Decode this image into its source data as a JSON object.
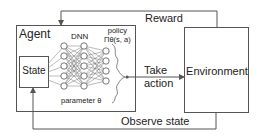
{
  "diagram": {
    "agent": {
      "label": "Agent"
    },
    "state": {
      "label": "State"
    },
    "dnn": {
      "label": "DNN",
      "parameter_label": "parameter θ",
      "layers": [
        5,
        5,
        4
      ]
    },
    "policy": {
      "label": "policy",
      "formula": "Πθ(s, a)"
    },
    "action": {
      "label_line1": "Take",
      "label_line2": "action"
    },
    "environment": {
      "label": "Environment"
    },
    "reward": {
      "label": "Reward"
    },
    "observe": {
      "label": "Observe state"
    },
    "colors": {
      "line": "#555555",
      "text": "#222222",
      "background": "#ffffff"
    }
  }
}
